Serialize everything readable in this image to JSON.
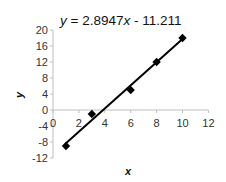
{
  "chart_data": {
    "type": "scatter",
    "title": "",
    "equation_prefix": "y",
    "equation_middle": " = 2.8947",
    "equation_var": "x",
    "equation_suffix": " - 11.211",
    "equation": "y = 2.8947x - 11.211",
    "xlabel": "x",
    "ylabel": "y",
    "xlim": [
      0,
      12
    ],
    "ylim": [
      -12,
      20
    ],
    "x_ticks": [
      "0",
      "2",
      "4",
      "6",
      "8",
      "10",
      "12"
    ],
    "y_ticks": [
      "20",
      "16",
      "12",
      "8",
      "4",
      "0",
      "-4",
      "-8",
      "-12"
    ],
    "grid": false,
    "legend": "none",
    "series": [
      {
        "name": "data",
        "marker": "diamond",
        "x": [
          1,
          3,
          6,
          8,
          10
        ],
        "y": [
          -9,
          -1,
          5,
          12,
          18
        ]
      }
    ],
    "trendline": {
      "type": "linear",
      "slope": 2.8947,
      "intercept": -11.211,
      "x_range": [
        1,
        10
      ]
    },
    "colors": {
      "marker": "#000000",
      "trendline": "#000000",
      "axis": "#bfbfbf",
      "tick_text": "#333333"
    }
  }
}
